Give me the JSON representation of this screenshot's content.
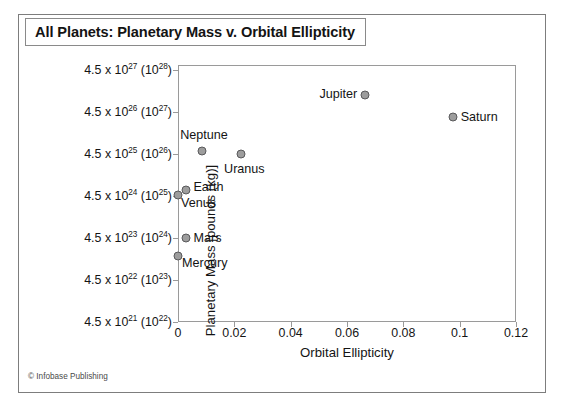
{
  "title": "All Planets: Planetary Mass v. Orbital Ellipticity",
  "credit": "© Infobase Publishing",
  "axes": {
    "x_title": "Orbital Ellipticity",
    "y_title": "Planetary Mass [pounds (kg)]",
    "x_ticks": [
      "0",
      "0.02",
      "0.04",
      "0.06",
      "0.08",
      "0.1",
      "0.12"
    ],
    "y_ticks": [
      {
        "mantissa": "4.5 x 10",
        "exp": "21",
        "paren_base": " (10",
        "paren_exp": "22",
        "paren_close": ")"
      },
      {
        "mantissa": "4.5 x 10",
        "exp": "22",
        "paren_base": " (10",
        "paren_exp": "23",
        "paren_close": ")"
      },
      {
        "mantissa": "4.5 x 10",
        "exp": "23",
        "paren_base": " (10",
        "paren_exp": "24",
        "paren_close": ")"
      },
      {
        "mantissa": "4.5 x 10",
        "exp": "24",
        "paren_base": " (10",
        "paren_exp": "25",
        "paren_close": ")"
      },
      {
        "mantissa": "4.5 x 10",
        "exp": "25",
        "paren_base": " (10",
        "paren_exp": "26",
        "paren_close": ")"
      },
      {
        "mantissa": "4.5 x 10",
        "exp": "26",
        "paren_base": " (10",
        "paren_exp": "27",
        "paren_close": ")"
      },
      {
        "mantissa": "4.5 x 10",
        "exp": "27",
        "paren_base": " (10",
        "paren_exp": "28",
        "paren_close": ")"
      }
    ]
  },
  "chart_data": {
    "type": "scatter",
    "title": "All Planets: Planetary Mass v. Orbital Ellipticity",
    "xlabel": "Orbital Ellipticity",
    "ylabel": "Planetary Mass [pounds (kg)]",
    "xlim": [
      0,
      0.12
    ],
    "ylim_log_decades": [
      "4.5e21",
      "4.5e27"
    ],
    "y_scale": "log",
    "grid": false,
    "legend": "none",
    "marker_color": "#9d9d9d",
    "marker_edge_color": "#59595b",
    "points": [
      {
        "name": "Mercury",
        "x": 0.0,
        "y_px_frac": 0.743,
        "label_pos": "below-right",
        "label_dx": 4,
        "label_dy": 7
      },
      {
        "name": "Venus",
        "x": 0.0,
        "y_px_frac": 0.507,
        "label_pos": "below-right",
        "label_dx": 3,
        "label_dy": 8
      },
      {
        "name": "Earth",
        "x": 0.003,
        "y_px_frac": 0.487,
        "label_pos": "right",
        "label_dx": 7,
        "label_dy": -3
      },
      {
        "name": "Mars",
        "x": 0.003,
        "y_px_frac": 0.673,
        "label_pos": "right",
        "label_dx": 7,
        "label_dy": 0
      },
      {
        "name": "Neptune",
        "x": 0.0085,
        "y_px_frac": 0.335,
        "label_pos": "above",
        "label_dx": 2,
        "label_dy": -9
      },
      {
        "name": "Uranus",
        "x": 0.0225,
        "y_px_frac": 0.345,
        "label_pos": "below",
        "label_dx": 3,
        "label_dy": 8
      },
      {
        "name": "Jupiter",
        "x": 0.0665,
        "y_px_frac": 0.117,
        "label_pos": "left",
        "label_dx": -8,
        "label_dy": -1
      },
      {
        "name": "Saturn",
        "x": 0.0975,
        "y_px_frac": 0.202,
        "label_pos": "right",
        "label_dx": 8,
        "label_dy": 0
      }
    ]
  }
}
